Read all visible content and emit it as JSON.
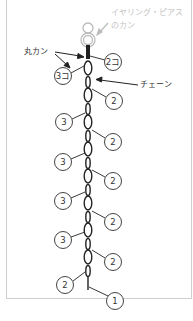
{
  "labels": {
    "earring_hook": "イヤリング・ピアス",
    "earring_hook_line2": "のカン",
    "jump_ring": "丸カン",
    "chain": "チェーン"
  },
  "count_markers": [
    {
      "text": "2コ",
      "x": 113,
      "y": 62,
      "side": "right"
    },
    {
      "text": "3コ",
      "x": 63,
      "y": 76,
      "side": "left"
    },
    {
      "text": "2",
      "x": 114,
      "y": 101,
      "side": "right"
    },
    {
      "text": "3",
      "x": 64,
      "y": 122,
      "side": "left"
    },
    {
      "text": "2",
      "x": 113,
      "y": 142,
      "side": "right"
    },
    {
      "text": "3",
      "x": 63,
      "y": 162,
      "side": "left"
    },
    {
      "text": "2",
      "x": 113,
      "y": 181,
      "side": "right"
    },
    {
      "text": "3",
      "x": 63,
      "y": 201,
      "side": "left"
    },
    {
      "text": "2",
      "x": 113,
      "y": 222,
      "side": "right"
    },
    {
      "text": "3",
      "x": 63,
      "y": 240,
      "side": "left"
    },
    {
      "text": "2",
      "x": 113,
      "y": 262,
      "side": "right"
    },
    {
      "text": "2",
      "x": 65,
      "y": 285,
      "side": "left"
    },
    {
      "text": "1",
      "x": 115,
      "y": 301,
      "side": "right"
    }
  ],
  "colors": {
    "ink": "#222222",
    "hook_gray": "#bbbbbb",
    "frame": "#cfcfcf"
  }
}
